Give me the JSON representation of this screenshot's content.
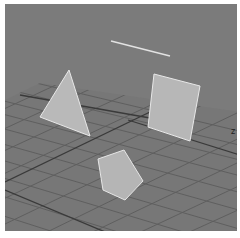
{
  "viewport": {
    "type": "3d-perspective-viewport",
    "background_color": "#7b7b7b",
    "floor_color": "#777777",
    "grid_line_color": "#5e5e5e",
    "grid_axis_color": "#3a3a3a",
    "shape_fill": "#b8b8b8",
    "shape_edge": "#e6e6e6",
    "axis_label": "z"
  },
  "objects": [
    {
      "name": "triangle",
      "points": "69,70 40,117 90,136"
    },
    {
      "name": "quad",
      "points": "154,74 200,86 190,141 148,127"
    },
    {
      "name": "pentagon",
      "points": "124,150 98,159 103,190 125,200 143,181"
    },
    {
      "name": "line",
      "x1": 111,
      "y1": 41,
      "x2": 170,
      "y2": 56
    }
  ]
}
